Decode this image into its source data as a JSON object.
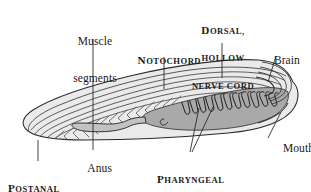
{
  "figure": {
    "background_color": "#ffffff",
    "body_fill": "#e9e9e9",
    "pharynx_fill": "#a9a9a9",
    "gut_fill": "#bcbcbc",
    "outline_color": "#2b2b2b",
    "leader_color": "#2b2b2b"
  },
  "labels": {
    "muscle_segments": {
      "line1": "Muscle",
      "line2": "segments",
      "style": "regular"
    },
    "dorsal_nerve_cord": {
      "line1_cap": "D",
      "line1_rest": "orsal,",
      "line2": "hollow",
      "line3": "nerve cord",
      "style": "small-caps"
    },
    "notochord": {
      "cap": "N",
      "rest": "otochord",
      "style": "small-caps"
    },
    "brain": {
      "text": "Brain",
      "style": "regular"
    },
    "mouth": {
      "text": "Mouth",
      "style": "regular"
    },
    "anus": {
      "text": "Anus",
      "style": "regular"
    },
    "pharyngeal_slits": {
      "line1_cap": "P",
      "line1_rest": "haryngeal",
      "line2": "slits",
      "style": "small-caps"
    },
    "postanal_tail": {
      "line1_cap": "P",
      "line1_rest": "ostanal",
      "line2": "tail",
      "style": "small-caps"
    }
  },
  "anatomy": {
    "pharyngeal_slit_count": 11,
    "muscle_chevron_count": 14
  }
}
